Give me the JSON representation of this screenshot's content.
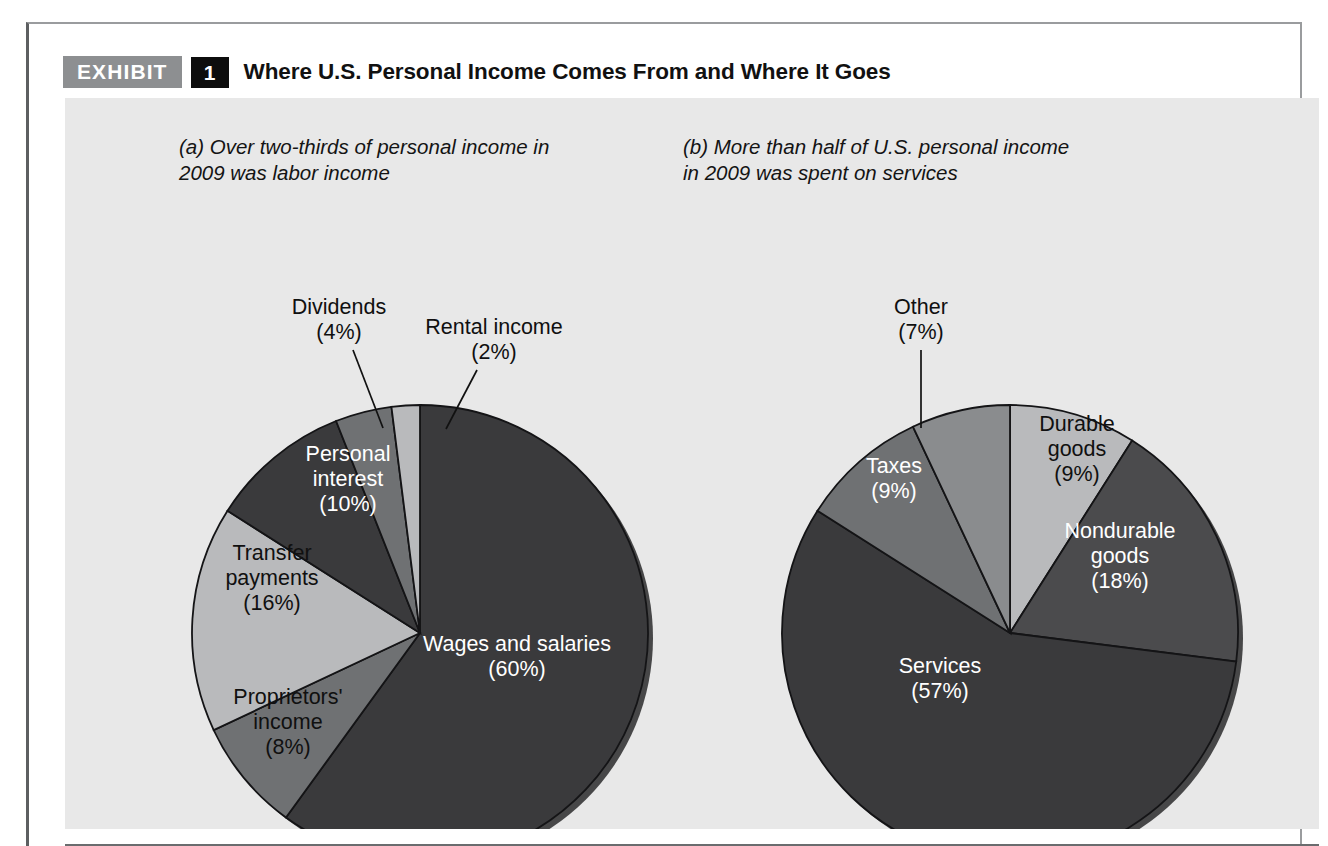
{
  "exhibit": {
    "badge_label": "EXHIBIT",
    "number": "1",
    "title": "Where U.S. Personal Income Comes From and Where It Goes"
  },
  "panel": {
    "background_color": "#e8e8e8",
    "caption_a": "(a) Over two-thirds of personal income in\n      2009 was labor income",
    "caption_a_marker": "(a)",
    "caption_a_text": "Over two-thirds of personal income in 2009 was labor income",
    "caption_b": "(b) More than half of U.S. personal income\n      in 2009 was spent on services",
    "caption_b_marker": "(b)",
    "caption_b_text": "More than half of U.S. personal income in 2009 was spent on services"
  },
  "footer": {
    "source_note": "Source: Based on data from the Bureau of Economic Analysis, U.S. Department of Commerce."
  },
  "colors": {
    "dark_slice": "#3a3a3c",
    "mid_slice": "#6f7173",
    "light_slice": "#b9babc",
    "slice_outline": "#141416",
    "badge_gray": "#8d8f91",
    "badge_black": "#0d0d0d",
    "panel_gray": "#e8e8e8"
  },
  "chart_data": [
    {
      "type": "pie",
      "id": "pie-a",
      "title": "Over two-thirds of personal income in 2009 was labor income",
      "marker": "(a)",
      "center": [
        355,
        535
      ],
      "radius": 228,
      "start_angle_deg": 0,
      "direction": "clockwise",
      "total": 100,
      "unit": "%",
      "categories": [
        "Wages and salaries",
        "Proprietors' income",
        "Transfer payments",
        "Personal interest",
        "Dividends",
        "Rental income"
      ],
      "values": [
        60,
        8,
        16,
        10,
        4,
        2
      ],
      "slices": [
        {
          "label": "Wages and salaries",
          "label_lines": [
            "Wages and salaries",
            "(60%)"
          ],
          "value": 60,
          "color": "#3a3a3c",
          "text_color": "#ffffff",
          "placement": "inside"
        },
        {
          "label": "Proprietors' income",
          "label_lines": [
            "Proprietors'",
            "income",
            "(8%)"
          ],
          "value": 8,
          "color": "#6f7173",
          "text_color": "#101010",
          "placement": "inside"
        },
        {
          "label": "Transfer payments",
          "label_lines": [
            "Transfer",
            "payments",
            "(16%)"
          ],
          "value": 16,
          "color": "#b9babc",
          "text_color": "#101010",
          "placement": "inside"
        },
        {
          "label": "Personal interest",
          "label_lines": [
            "Personal",
            "interest",
            "(10%)"
          ],
          "value": 10,
          "color": "#3a3a3c",
          "text_color": "#ffffff",
          "placement": "inside"
        },
        {
          "label": "Dividends",
          "label_lines": [
            "Dividends",
            "(4%)"
          ],
          "value": 4,
          "color": "#6f7173",
          "text_color": "#101010",
          "placement": "callout"
        },
        {
          "label": "Rental income",
          "label_lines": [
            "Rental income",
            "(2%)"
          ],
          "value": 2,
          "color": "#b9babc",
          "text_color": "#101010",
          "placement": "callout"
        }
      ]
    },
    {
      "type": "pie",
      "id": "pie-b",
      "title": "More than half of U.S. personal income in 2009 was spent on services",
      "marker": "(b)",
      "center": [
        945,
        535
      ],
      "radius": 228,
      "start_angle_deg": 0,
      "direction": "clockwise",
      "total": 100,
      "unit": "%",
      "categories": [
        "Durable goods",
        "Nondurable goods",
        "Services",
        "Taxes",
        "Other"
      ],
      "values": [
        9,
        18,
        57,
        9,
        7
      ],
      "slices": [
        {
          "label": "Durable goods",
          "label_lines": [
            "Durable",
            "goods",
            "(9%)"
          ],
          "value": 9,
          "color": "#b9babc",
          "text_color": "#101010",
          "placement": "inside"
        },
        {
          "label": "Nondurable goods",
          "label_lines": [
            "Nondurable",
            "goods",
            "(18%)"
          ],
          "value": 18,
          "color": "#4b4b4d",
          "text_color": "#ffffff",
          "placement": "inside"
        },
        {
          "label": "Services",
          "label_lines": [
            "Services",
            "(57%)"
          ],
          "value": 57,
          "color": "#3a3a3c",
          "text_color": "#ffffff",
          "placement": "inside"
        },
        {
          "label": "Taxes",
          "label_lines": [
            "Taxes",
            "(9%)"
          ],
          "value": 9,
          "color": "#6f7173",
          "text_color": "#ffffff",
          "placement": "inside"
        },
        {
          "label": "Other",
          "label_lines": [
            "Other",
            "(7%)"
          ],
          "value": 7,
          "color": "#8a8c8e",
          "text_color": "#101010",
          "placement": "callout"
        }
      ]
    }
  ],
  "label_positions": {
    "pie_a": {
      "wages_and_salaries": [
        452,
        559
      ],
      "proprietors_income": [
        223,
        625
      ],
      "transfer_payments": [
        207,
        481
      ],
      "personal_interest": [
        283,
        382
      ],
      "dividends_callout": [
        274,
        222
      ],
      "dividends_leader": [
        [
          288,
          252
        ],
        [
          318,
          330
        ]
      ],
      "rental_callout": [
        429,
        242
      ],
      "rental_leader": [
        [
          412,
          272
        ],
        [
          381,
          331
        ]
      ]
    },
    "pie_b": {
      "durable_goods": [
        1012,
        352
      ],
      "nondurable_goods": [
        1055,
        459
      ],
      "services": [
        875,
        581
      ],
      "taxes": [
        829,
        381
      ],
      "other_callout": [
        856,
        222
      ],
      "other_leader": [
        [
          856,
          252
        ],
        [
          856,
          330
        ]
      ]
    }
  }
}
